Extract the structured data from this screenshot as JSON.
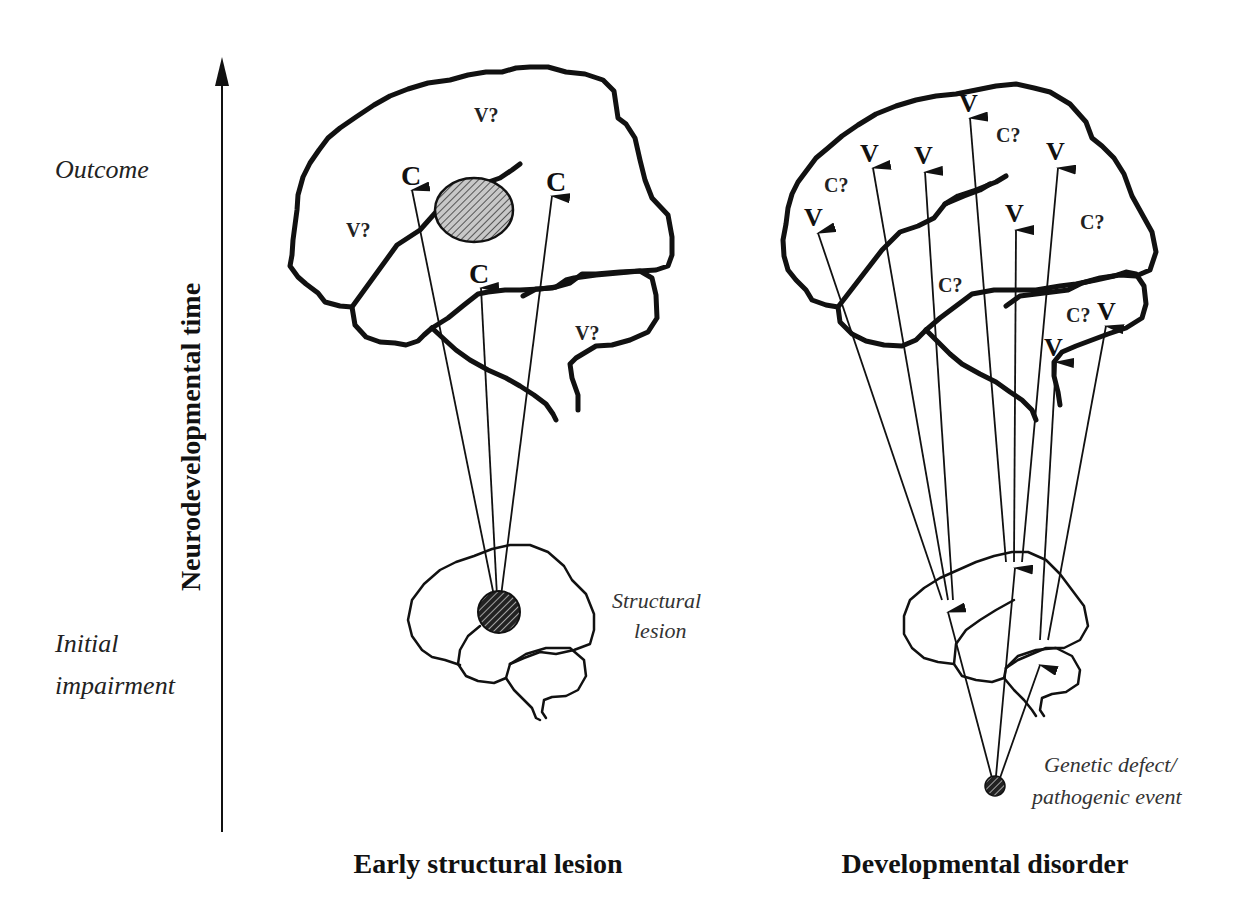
{
  "axis": {
    "title": "Neurodevelopmental time",
    "top_label": "Outcome",
    "bottom_label_line1": "Initial",
    "bottom_label_line2": "impairment"
  },
  "panels": [
    {
      "id": "left",
      "caption": "Early structural lesion",
      "origin_label_line1": "Structural",
      "origin_label_line2": "lesion",
      "outcome_marks": [
        {
          "text": "V?",
          "kind": "uncertain"
        },
        {
          "text": "V?",
          "kind": "uncertain"
        },
        {
          "text": "V?",
          "kind": "uncertain"
        },
        {
          "text": "C",
          "kind": "arrow-target"
        },
        {
          "text": "C",
          "kind": "arrow-target"
        },
        {
          "text": "C",
          "kind": "arrow-target"
        }
      ]
    },
    {
      "id": "right",
      "caption": "Developmental disorder",
      "origin_label_line1": "Genetic defect/",
      "origin_label_line2": "pathogenic event",
      "outcome_marks": [
        {
          "text": "V",
          "kind": "arrow-target"
        },
        {
          "text": "V",
          "kind": "arrow-target"
        },
        {
          "text": "V",
          "kind": "arrow-target"
        },
        {
          "text": "V",
          "kind": "arrow-target"
        },
        {
          "text": "V",
          "kind": "arrow-target"
        },
        {
          "text": "V",
          "kind": "arrow-target"
        },
        {
          "text": "V",
          "kind": "arrow-target"
        },
        {
          "text": "V",
          "kind": "arrow-target"
        },
        {
          "text": "C?",
          "kind": "uncertain"
        },
        {
          "text": "C?",
          "kind": "uncertain"
        },
        {
          "text": "C?",
          "kind": "uncertain"
        },
        {
          "text": "C?",
          "kind": "uncertain"
        },
        {
          "text": "C?",
          "kind": "uncertain"
        }
      ]
    }
  ]
}
